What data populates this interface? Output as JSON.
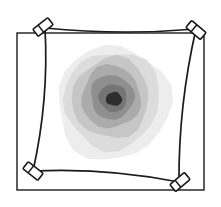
{
  "figure": {
    "title": "Clamped membrane with radial contour field",
    "background_color": "#ffffff",
    "width": 221,
    "height": 207,
    "stroke_color": "#1a1a1a",
    "clip_fill_color": "#ffffff"
  },
  "outer_frame": {
    "label": "outer rectangular boundary",
    "x": 17,
    "y": 33,
    "width": 187,
    "height": 157,
    "stroke_width": 1.4
  },
  "membrane": {
    "label": "curved quadrilateral membrane edge",
    "stroke_width": 1.7,
    "corners": [
      {
        "name": "top-left",
        "x": 45,
        "y": 28
      },
      {
        "name": "top-right",
        "x": 196,
        "y": 29
      },
      {
        "name": "bottom-right",
        "x": 179,
        "y": 182
      },
      {
        "name": "bottom-left",
        "x": 33,
        "y": 171
      }
    ],
    "edge_bow": {
      "top": 7,
      "right": 9,
      "bottom": 9,
      "left": 10
    }
  },
  "clips": [
    {
      "name": "clip-top-left",
      "cx": 43,
      "cy": 27,
      "rotation": -38,
      "length": 19,
      "thickness": 9
    },
    {
      "name": "clip-top-right",
      "cx": 196,
      "cy": 30,
      "rotation": 40,
      "length": 19,
      "thickness": 9
    },
    {
      "name": "clip-bottom-right",
      "cx": 180,
      "cy": 182,
      "rotation": -40,
      "length": 19,
      "thickness": 9
    },
    {
      "name": "clip-bottom-left",
      "cx": 33,
      "cy": 171,
      "rotation": 38,
      "length": 19,
      "thickness": 9
    }
  ],
  "contour_field": {
    "label": "radial grayscale contour blob",
    "center": {
      "x": 113,
      "y": 101
    },
    "ring_count": 7,
    "rings": [
      {
        "level": 1,
        "radius_x": 56,
        "radius_y": 58,
        "color": "#ededed",
        "offset_x": 0,
        "offset_y": 2
      },
      {
        "level": 2,
        "radius_x": 48,
        "radius_y": 49,
        "color": "#dcdcdc",
        "offset_x": -1,
        "offset_y": -1
      },
      {
        "level": 3,
        "radius_x": 39,
        "radius_y": 40,
        "color": "#c6c6c6",
        "offset_x": -2,
        "offset_y": -3
      },
      {
        "level": 4,
        "radius_x": 30,
        "radius_y": 31,
        "color": "#ababab",
        "offset_x": -2,
        "offset_y": -4
      },
      {
        "level": 5,
        "radius_x": 22,
        "radius_y": 22,
        "color": "#8f8f8f",
        "offset_x": -1,
        "offset_y": -4
      },
      {
        "level": 6,
        "radius_x": 14,
        "radius_y": 14,
        "color": "#757575",
        "offset_x": 0,
        "offset_y": -3
      },
      {
        "level": 7,
        "radius_x": 8,
        "radius_y": 7,
        "color": "#2e2e2e",
        "offset_x": 1,
        "offset_y": -2
      }
    ]
  },
  "chart_data": {
    "type": "heatmap",
    "title": "Clamped membrane with radial contour field",
    "xlabel": "",
    "ylabel": "",
    "legend": [],
    "center": [
      113,
      101
    ],
    "levels": [
      1,
      2,
      3,
      4,
      5,
      6,
      7
    ],
    "level_colors": [
      "#ededed",
      "#dcdcdc",
      "#c6c6c6",
      "#ababab",
      "#8f8f8f",
      "#757575",
      "#2e2e2e"
    ],
    "level_radii": [
      57,
      48,
      39,
      30,
      22,
      14,
      8
    ],
    "grid": false
  }
}
